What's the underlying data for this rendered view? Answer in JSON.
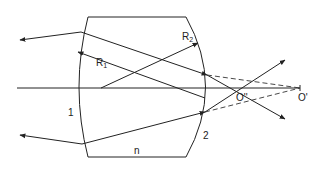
{
  "diagram": {
    "type": "optical ray diagram",
    "labels": {
      "radius1": "R",
      "radius1_sub": "1",
      "radius2": "R",
      "radius2_sub": "2",
      "surface1": "1",
      "surface2": "2",
      "index": "n",
      "image_inner": "O''",
      "image_outer": "O'"
    },
    "colors": {
      "line": "#222222",
      "background": "#ffffff"
    },
    "elements": [
      "lens outline",
      "optical axis",
      "incident ray top",
      "incident ray bottom",
      "refracted rays",
      "dashed virtual rays",
      "radius arrows R1 and R2"
    ]
  }
}
